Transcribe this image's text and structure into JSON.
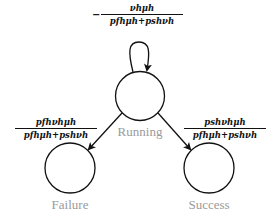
{
  "diagram": {
    "type": "state-transition",
    "states": [
      {
        "id": "running",
        "label": "Running"
      },
      {
        "id": "failure",
        "label": "Failure"
      },
      {
        "id": "success",
        "label": "Success"
      }
    ],
    "transitions": [
      {
        "from": "running",
        "to": "running",
        "sign": "−",
        "numerator": "νhμh",
        "denominator": "pfhμh+pshνh"
      },
      {
        "from": "running",
        "to": "failure",
        "numerator": "pfhνhμh",
        "denominator": "pfhμh+pshνh"
      },
      {
        "from": "running",
        "to": "success",
        "numerator": "pshνhμh",
        "denominator": "pfhμh+pshνh"
      }
    ],
    "colors": {
      "line": "#111111",
      "label": "#9a9a9a"
    }
  }
}
